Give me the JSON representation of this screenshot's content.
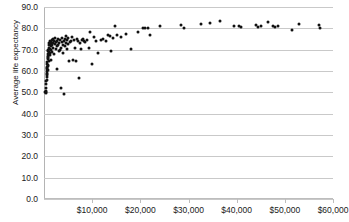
{
  "chart_data": {
    "type": "scatter",
    "title": "",
    "xlabel": "",
    "ylabel": "Average life expectancy",
    "xlim": [
      0,
      60000
    ],
    "ylim": [
      0,
      90
    ],
    "grid": "horizontal",
    "legend": "none",
    "marker": {
      "shape": "circle",
      "color": "#111111",
      "size": 3
    },
    "y_ticks": [
      "0.0",
      "10.0",
      "20.0",
      "30.0",
      "40.0",
      "50.0",
      "60.0",
      "70.0",
      "80.0",
      "90.0"
    ],
    "y_tick_values": [
      0,
      10,
      20,
      30,
      40,
      50,
      60,
      70,
      80,
      90
    ],
    "x_ticks": [
      "$10,000",
      "$20,000",
      "$30,000",
      "$40,000",
      "$50,000",
      "$60,000"
    ],
    "x_tick_values": [
      10000,
      20000,
      30000,
      40000,
      50000,
      60000
    ],
    "points": [
      [
        300,
        50.1
      ],
      [
        350,
        50.4
      ],
      [
        400,
        49.8
      ],
      [
        420,
        52.0
      ],
      [
        450,
        50.2
      ],
      [
        470,
        54.0
      ],
      [
        500,
        55.2
      ],
      [
        520,
        57.0
      ],
      [
        540,
        58.5
      ],
      [
        560,
        56.0
      ],
      [
        580,
        60.0
      ],
      [
        600,
        61.5
      ],
      [
        620,
        59.0
      ],
      [
        640,
        62.0
      ],
      [
        660,
        63.5
      ],
      [
        680,
        58.0
      ],
      [
        700,
        64.0
      ],
      [
        720,
        61.0
      ],
      [
        740,
        65.5
      ],
      [
        760,
        66.0
      ],
      [
        780,
        60.5
      ],
      [
        800,
        67.0
      ],
      [
        820,
        63.0
      ],
      [
        840,
        68.0
      ],
      [
        860,
        69.5
      ],
      [
        880,
        62.5
      ],
      [
        900,
        70.0
      ],
      [
        920,
        66.5
      ],
      [
        950,
        71.0
      ],
      [
        980,
        64.5
      ],
      [
        1000,
        72.0
      ],
      [
        1050,
        69.0
      ],
      [
        1100,
        73.0
      ],
      [
        1150,
        67.5
      ],
      [
        1200,
        70.5
      ],
      [
        1250,
        74.0
      ],
      [
        1300,
        68.5
      ],
      [
        1350,
        71.5
      ],
      [
        1400,
        72.5
      ],
      [
        1450,
        65.0
      ],
      [
        1500,
        73.5
      ],
      [
        1550,
        70.0
      ],
      [
        1600,
        74.5
      ],
      [
        1650,
        69.0
      ],
      [
        1700,
        72.0
      ],
      [
        1800,
        75.0
      ],
      [
        1850,
        71.0
      ],
      [
        1900,
        73.0
      ],
      [
        2000,
        74.0
      ],
      [
        2100,
        68.0
      ],
      [
        2200,
        72.5
      ],
      [
        2300,
        75.5
      ],
      [
        2400,
        70.5
      ],
      [
        2500,
        73.5
      ],
      [
        2600,
        71.5
      ],
      [
        2700,
        74.0
      ],
      [
        2800,
        61.0
      ],
      [
        2900,
        72.0
      ],
      [
        3000,
        75.0
      ],
      [
        3100,
        69.5
      ],
      [
        3200,
        73.0
      ],
      [
        3300,
        70.0
      ],
      [
        3400,
        74.5
      ],
      [
        3500,
        71.0
      ],
      [
        3600,
        52.2
      ],
      [
        3700,
        73.5
      ],
      [
        3800,
        75.5
      ],
      [
        3900,
        68.5
      ],
      [
        4000,
        72.0
      ],
      [
        4100,
        74.0
      ],
      [
        4200,
        49.0
      ],
      [
        4300,
        71.5
      ],
      [
        4400,
        75.0
      ],
      [
        4500,
        73.0
      ],
      [
        4600,
        76.5
      ],
      [
        4700,
        70.5
      ],
      [
        4800,
        74.5
      ],
      [
        4900,
        72.5
      ],
      [
        5000,
        75.5
      ],
      [
        5200,
        64.5
      ],
      [
        5400,
        73.5
      ],
      [
        5600,
        74.0
      ],
      [
        5800,
        76.0
      ],
      [
        6000,
        65.0
      ],
      [
        6200,
        74.5
      ],
      [
        6400,
        71.0
      ],
      [
        6600,
        64.8
      ],
      [
        6800,
        75.0
      ],
      [
        7000,
        74.0
      ],
      [
        7200,
        56.5
      ],
      [
        7400,
        73.0
      ],
      [
        7600,
        70.5
      ],
      [
        7800,
        74.5
      ],
      [
        8000,
        75.0
      ],
      [
        8300,
        74.0
      ],
      [
        8600,
        73.5
      ],
      [
        9000,
        74.5
      ],
      [
        9300,
        71.0
      ],
      [
        9600,
        78.5
      ],
      [
        10000,
        63.5
      ],
      [
        10300,
        76.0
      ],
      [
        10800,
        74.0
      ],
      [
        11200,
        68.5
      ],
      [
        11800,
        74.5
      ],
      [
        12300,
        75.0
      ],
      [
        12800,
        74.0
      ],
      [
        13200,
        77.0
      ],
      [
        13600,
        76.5
      ],
      [
        14000,
        69.5
      ],
      [
        14400,
        75.5
      ],
      [
        14800,
        81.0
      ],
      [
        15200,
        77.0
      ],
      [
        16000,
        76.0
      ],
      [
        17000,
        77.5
      ],
      [
        18000,
        70.2
      ],
      [
        19500,
        78.5
      ],
      [
        20500,
        80.0
      ],
      [
        21000,
        80.2
      ],
      [
        21500,
        80.0
      ],
      [
        22000,
        77.0
      ],
      [
        24000,
        81.2
      ],
      [
        28500,
        81.5
      ],
      [
        29000,
        80.0
      ],
      [
        32500,
        82.0
      ],
      [
        34500,
        82.5
      ],
      [
        36500,
        83.5
      ],
      [
        39500,
        81.2
      ],
      [
        40500,
        81.3
      ],
      [
        41000,
        80.8
      ],
      [
        44000,
        81.5
      ],
      [
        44500,
        80.8
      ],
      [
        45000,
        81.0
      ],
      [
        46500,
        83.0
      ],
      [
        47500,
        81.0
      ],
      [
        48000,
        80.8
      ],
      [
        48500,
        81.0
      ],
      [
        51500,
        79.3
      ],
      [
        53000,
        81.8
      ],
      [
        57000,
        81.5
      ],
      [
        57200,
        80.2
      ]
    ]
  }
}
